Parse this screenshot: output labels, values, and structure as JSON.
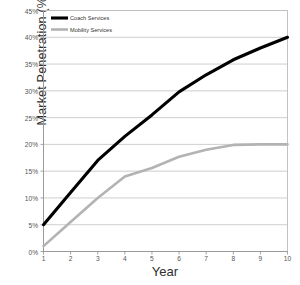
{
  "chart_data": {
    "type": "line",
    "title": "",
    "xlabel": "Year",
    "ylabel": "Market Penetration (%)",
    "x": [
      1,
      2,
      3,
      4,
      5,
      6,
      7,
      8,
      9,
      10
    ],
    "xtick_labels": [
      "1",
      "2",
      "3",
      "4",
      "5",
      "6",
      "7",
      "8",
      "9",
      "10"
    ],
    "ytick_labels": [
      "0%",
      "5%",
      "10%",
      "15%",
      "20%",
      "25%",
      "30%",
      "35%",
      "40%",
      "45%"
    ],
    "ytick_values": [
      0,
      5,
      10,
      15,
      20,
      25,
      30,
      35,
      40,
      45
    ],
    "ylim": [
      0,
      45
    ],
    "xlim": [
      1,
      10
    ],
    "grid": "horizontal",
    "legend_position": "top-left-inside",
    "series": [
      {
        "name": "Coach Services",
        "color": "#000000",
        "width": 3.1,
        "values": [
          5.0,
          11.0,
          17.0,
          21.5,
          25.5,
          29.8,
          33.0,
          35.8,
          38.0,
          40.0
        ]
      },
      {
        "name": "Mobility Services",
        "color": "#b3b3b3",
        "width": 2.6,
        "values": [
          1.0,
          5.5,
          10.0,
          14.0,
          15.6,
          17.7,
          19.0,
          19.9,
          20.0,
          20.0
        ]
      }
    ]
  },
  "legend": {
    "items": [
      {
        "label": "Coach Services",
        "color": "#000000"
      },
      {
        "label": "Mobility Services",
        "color": "#b3b3b3"
      }
    ]
  },
  "colors": {
    "gridline": "#c8c8c8",
    "axis": "#9a9a9a",
    "plot_border": "#bdbdbd",
    "background": "#ffffff",
    "text": "#333333"
  }
}
